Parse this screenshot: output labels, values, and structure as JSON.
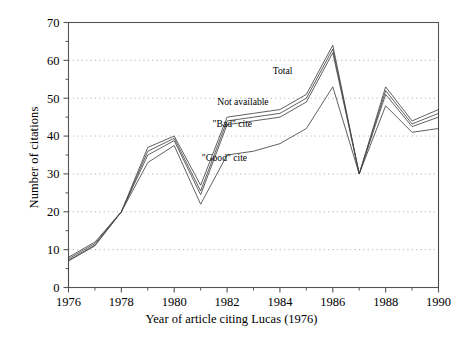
{
  "chart_data": {
    "type": "line",
    "title": "",
    "xlabel": "Year of article citing Lucas (1976)",
    "ylabel": "Number of citations",
    "xlim": [
      1976,
      1990
    ],
    "ylim": [
      0,
      70
    ],
    "yticks": [
      0,
      10,
      20,
      30,
      40,
      50,
      60,
      70
    ],
    "ytick_labels": [
      "0",
      "10",
      "20",
      "30",
      "40",
      "50",
      "60",
      "70"
    ],
    "xticks": [
      1976,
      1978,
      1980,
      1982,
      1984,
      1986,
      1988,
      1990
    ],
    "xtick_labels": [
      "1976",
      "1978",
      "1980",
      "1982",
      "1984",
      "1986",
      "1988",
      "1990"
    ],
    "x_minor_ticks": [
      1977,
      1979,
      1981,
      1983,
      1985,
      1987,
      1989
    ],
    "grid": "horizontal-dotted",
    "legend": "inline-annotations",
    "line_color": "#444444",
    "axis_color": "#555555",
    "grid_color": "#9a9a9a",
    "x": [
      1976,
      1977,
      1978,
      1979,
      1980,
      1981,
      1982,
      1983,
      1984,
      1985,
      1986,
      1987,
      1988,
      1989,
      1990
    ],
    "series": [
      {
        "name": "Total",
        "label": "Total",
        "label_x": 1984.1,
        "label_y": 56.5,
        "values": [
          8,
          12,
          20,
          37,
          40,
          27,
          45,
          46,
          47,
          51,
          64,
          30,
          53,
          44,
          47
        ]
      },
      {
        "name": "Not available",
        "label": "Not available",
        "label_x": 1982.6,
        "label_y": 48.2,
        "values": [
          7.6,
          11.6,
          20,
          36,
          39.4,
          25.5,
          44,
          45,
          46,
          50,
          63,
          30,
          52,
          43.2,
          46
        ]
      },
      {
        "name": "\"Bad\" cite",
        "label": "\"Bad\" cite",
        "label_x": 1982.2,
        "label_y": 42.5,
        "values": [
          7.2,
          11.2,
          20,
          35,
          38.8,
          24.5,
          43,
          44,
          45,
          49,
          62,
          30,
          51,
          42.5,
          45
        ]
      },
      {
        "name": "\"Good\" cite",
        "label": "\"Good\" cite",
        "label_x": 1981.9,
        "label_y": 33.5,
        "values": [
          7,
          11,
          20,
          33,
          37.5,
          22,
          35,
          36,
          38,
          42,
          53,
          30,
          48,
          41,
          42
        ]
      }
    ],
    "baseline_drops": [
      {
        "x": 1976,
        "from": 8,
        "to": 0
      },
      {
        "x": 1990,
        "from": 47,
        "to": 0
      }
    ]
  }
}
